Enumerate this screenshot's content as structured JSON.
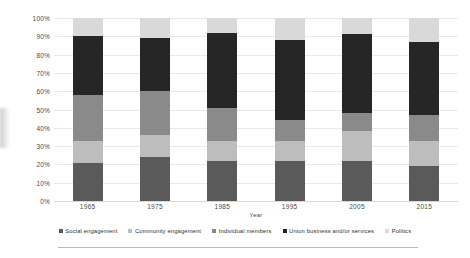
{
  "chart_data": {
    "type": "bar",
    "subtype": "stacked-percentage-column",
    "title": "",
    "xlabel": "Year",
    "ylabel": "",
    "ylim": [
      0,
      100
    ],
    "ytick_labels": [
      "100%",
      "90%",
      "80%",
      "70%",
      "60%",
      "50%",
      "40%",
      "30%",
      "20%",
      "10%",
      "0%"
    ],
    "ytick_values": [
      100,
      90,
      80,
      70,
      60,
      50,
      40,
      30,
      20,
      10,
      0
    ],
    "grid": true,
    "legend_position": "bottom",
    "categories": [
      "1965",
      "1975",
      "1985",
      "1995",
      "2005",
      "2015"
    ],
    "series": [
      {
        "name": "Social engagement",
        "color": "#5a5a5a",
        "values": [
          21,
          24,
          22,
          22,
          22,
          19
        ]
      },
      {
        "name": "Community engagement",
        "color": "#bdbdbd",
        "values": [
          12,
          12,
          11,
          11,
          16,
          14
        ]
      },
      {
        "name": "Individual members",
        "color": "#8a8a8a",
        "values": [
          25,
          24,
          18,
          11,
          10,
          14
        ]
      },
      {
        "name": "Union business and/or services",
        "color": "#262626",
        "values": [
          32,
          29,
          41,
          44,
          43,
          40
        ]
      },
      {
        "name": "Politics",
        "color": "#d9d9d9",
        "values": [
          10,
          11,
          8,
          12,
          9,
          13
        ]
      }
    ]
  },
  "legend": {
    "items": [
      {
        "label": "Social engagement",
        "color": "#5a5a5a"
      },
      {
        "label": "Community engagement",
        "color": "#bdbdbd"
      },
      {
        "label": "Individual members",
        "color": "#8a8a8a"
      },
      {
        "label": "Union business and/or services",
        "color": "#262626"
      },
      {
        "label": "Politics",
        "color": "#d9d9d9"
      }
    ]
  }
}
